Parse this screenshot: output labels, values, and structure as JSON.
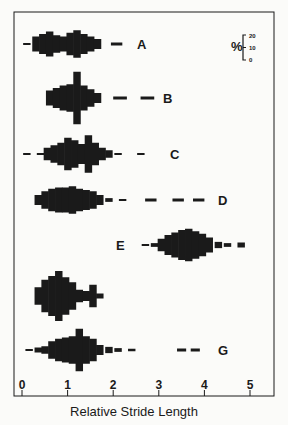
{
  "chart_data": {
    "type": "bar",
    "subtype": "kite-diagram histograms (symmetric frequency distributions)",
    "title": "",
    "xlabel": "Relative Stride Length",
    "ylabel": "",
    "xlim": [
      0,
      5.3
    ],
    "xticks": [
      0,
      1,
      2,
      3,
      4,
      5
    ],
    "bin_width": 0.15,
    "frequency_scale": {
      "label": "%",
      "ticks": [
        0,
        10,
        20
      ]
    },
    "grid": false,
    "series": [
      {
        "name": "A",
        "center_y": 44,
        "bins": [
          [
            0.1,
            1
          ],
          [
            0.3,
            12
          ],
          [
            0.45,
            16
          ],
          [
            0.6,
            20
          ],
          [
            0.75,
            14
          ],
          [
            0.9,
            12
          ],
          [
            1.05,
            18
          ],
          [
            1.2,
            22
          ],
          [
            1.35,
            16
          ],
          [
            1.5,
            12
          ],
          [
            1.65,
            8
          ]
        ],
        "dashes": [
          [
            1.95,
            2.2
          ]
        ]
      },
      {
        "name": "B",
        "center_y": 98,
        "bins": [
          [
            0.6,
            12
          ],
          [
            0.75,
            16
          ],
          [
            0.9,
            20
          ],
          [
            1.05,
            22
          ],
          [
            1.2,
            42
          ],
          [
            1.35,
            20
          ],
          [
            1.5,
            14
          ],
          [
            1.65,
            8
          ]
        ],
        "dashes": [
          [
            2.0,
            2.3
          ],
          [
            2.6,
            2.9
          ]
        ]
      },
      {
        "name": "C",
        "center_y": 154,
        "bins": [
          [
            0.1,
            1.5
          ],
          [
            0.4,
            1.5
          ],
          [
            0.55,
            10
          ],
          [
            0.7,
            14
          ],
          [
            0.85,
            18
          ],
          [
            1.0,
            26
          ],
          [
            1.15,
            22
          ],
          [
            1.3,
            16
          ],
          [
            1.45,
            30
          ],
          [
            1.6,
            18
          ],
          [
            1.75,
            10
          ],
          [
            1.9,
            6
          ],
          [
            2.1,
            1.5
          ],
          [
            2.6,
            1.5
          ]
        ],
        "dashes": []
      },
      {
        "name": "D",
        "center_y": 200,
        "bins": [
          [
            0.35,
            8
          ],
          [
            0.5,
            14
          ],
          [
            0.65,
            18
          ],
          [
            0.8,
            20
          ],
          [
            0.95,
            20
          ],
          [
            1.1,
            22
          ],
          [
            1.25,
            18
          ],
          [
            1.4,
            16
          ],
          [
            1.55,
            14
          ],
          [
            1.7,
            8
          ],
          [
            1.9,
            3
          ],
          [
            2.2,
            1.5
          ]
        ],
        "dashes": [
          [
            2.7,
            2.95
          ],
          [
            3.3,
            3.55
          ],
          [
            3.75,
            4.0
          ]
        ]
      },
      {
        "name": "E",
        "center_y": 245,
        "bins": [
          [
            2.7,
            1.5
          ],
          [
            2.9,
            3
          ],
          [
            3.05,
            10
          ],
          [
            3.2,
            16
          ],
          [
            3.35,
            20
          ],
          [
            3.5,
            24
          ],
          [
            3.65,
            26
          ],
          [
            3.8,
            22
          ],
          [
            3.95,
            18
          ],
          [
            4.1,
            12
          ],
          [
            4.3,
            5
          ],
          [
            4.5,
            3
          ],
          [
            4.8,
            4
          ]
        ],
        "dashes": []
      },
      {
        "name": "F",
        "center_y": 296,
        "bins": [
          [
            0.35,
            14
          ],
          [
            0.5,
            26
          ],
          [
            0.65,
            32
          ],
          [
            0.8,
            40
          ],
          [
            0.95,
            30
          ],
          [
            1.1,
            22
          ],
          [
            1.25,
            10
          ],
          [
            1.4,
            8
          ],
          [
            1.55,
            18
          ],
          [
            1.7,
            4
          ]
        ],
        "dashes": []
      },
      {
        "name": "G",
        "center_y": 350,
        "bins": [
          [
            0.15,
            1.5
          ],
          [
            0.35,
            4
          ],
          [
            0.5,
            6
          ],
          [
            0.65,
            14
          ],
          [
            0.8,
            18
          ],
          [
            0.95,
            20
          ],
          [
            1.1,
            22
          ],
          [
            1.25,
            34
          ],
          [
            1.4,
            22
          ],
          [
            1.55,
            18
          ],
          [
            1.7,
            8
          ],
          [
            1.9,
            5
          ],
          [
            2.1,
            3
          ],
          [
            2.4,
            2
          ]
        ],
        "dashes": [
          [
            3.4,
            3.6
          ],
          [
            3.7,
            3.9
          ]
        ]
      }
    ]
  },
  "labels": {
    "xlabel": "Relative Stride Length",
    "ticks": [
      "0",
      "1",
      "2",
      "3",
      "4",
      "5"
    ],
    "percent_symbol": "%",
    "scale_ticks": [
      "20",
      "10",
      "0"
    ],
    "series_names": [
      "A",
      "B",
      "C",
      "D",
      "E",
      "F",
      "G"
    ]
  },
  "colors": {
    "ink": "#1a1a1a",
    "background": "#fbfbf9"
  }
}
